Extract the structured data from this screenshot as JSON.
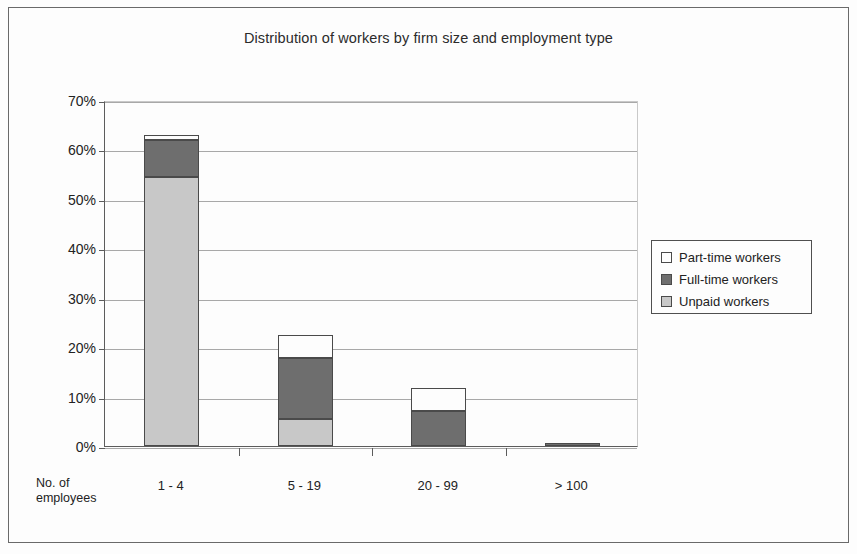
{
  "chart_data": {
    "type": "bar",
    "subtype": "stacked",
    "title": "Distribution of workers by firm size and employment type",
    "xlabel": "No. of employees",
    "ylabel": "",
    "categories": [
      "1 - 4",
      "5 - 19",
      "20 - 99",
      "> 100"
    ],
    "series": [
      {
        "name": "Unpaid workers",
        "color": "#c8c8c8",
        "values": [
          54.5,
          5.5,
          0.0,
          0.0
        ]
      },
      {
        "name": "Full-time workers",
        "color": "#6e6e6e",
        "values": [
          7.5,
          12.3,
          7.0,
          0.6
        ]
      },
      {
        "name": "Part-time workers",
        "color": "#fdfdfd",
        "values": [
          1.0,
          4.7,
          4.8,
          0.0
        ]
      }
    ],
    "totals": [
      63.0,
      22.5,
      11.8,
      0.6
    ],
    "ylim": [
      0,
      70
    ],
    "ytick_values": [
      0,
      10,
      20,
      30,
      40,
      50,
      60,
      70
    ],
    "ytick_labels": [
      "0%",
      "10%",
      "20%",
      "30%",
      "40%",
      "50%",
      "60%",
      "70%"
    ],
    "grid": true,
    "legend_position": "right"
  },
  "axis": {
    "caption_line1": "No. of",
    "caption_line2": "employees"
  },
  "legend": {
    "items": [
      {
        "label": "Part-time workers",
        "swatch": "part-time-swatch"
      },
      {
        "label": "Full-time workers",
        "swatch": "full-time-swatch"
      },
      {
        "label": "Unpaid workers",
        "swatch": "unpaid-swatch"
      }
    ]
  }
}
